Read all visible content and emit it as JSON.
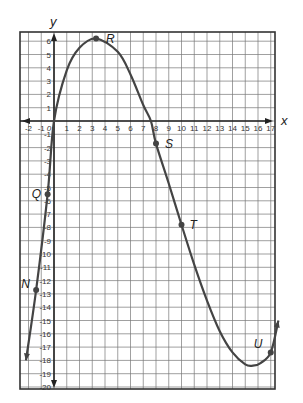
{
  "chart_data": {
    "type": "line",
    "title": "",
    "xlabel": "x",
    "ylabel": "y",
    "xlim": [
      -2.7,
      17.7
    ],
    "ylim": [
      -20.8,
      6.6
    ],
    "grid": true,
    "x_ticks": [
      -2,
      -1,
      0,
      1,
      2,
      3,
      4,
      5,
      6,
      7,
      8,
      9,
      10,
      11,
      12,
      13,
      14,
      15,
      16,
      17
    ],
    "y_ticks": [
      6,
      5,
      4,
      3,
      2,
      1,
      -1,
      -2,
      -3,
      -4,
      -5,
      -6,
      -7,
      -8,
      -9,
      -10,
      -11,
      -12,
      -13,
      -14,
      -15,
      -16,
      -17,
      -18,
      -19,
      -20
    ],
    "x_tick_labels": [
      "-2",
      "-1",
      "0",
      "1",
      "2",
      "3",
      "4",
      "5",
      "6",
      "7",
      "8",
      "9",
      "10",
      "11",
      "12",
      "13",
      "14",
      "15",
      "16",
      "17"
    ],
    "y_tick_labels": [
      "6",
      "5",
      "4",
      "3",
      "2",
      "1",
      "-1",
      "-2",
      "-3",
      "-4",
      "-5",
      "-6",
      "-7",
      "-8",
      "-9",
      "-10",
      "-11",
      "-12",
      "-13",
      "-14",
      "-15",
      "-16",
      "-17",
      "-18",
      "-19",
      "-20"
    ],
    "series": [
      {
        "name": "curve",
        "x": [
          -2.2,
          -1.4,
          -0.5,
          0,
          1,
          2,
          3.3,
          5,
          6,
          7,
          7.6,
          8,
          9,
          10,
          11,
          12,
          13,
          14,
          15,
          15.6,
          16.2,
          17,
          17.6
        ],
        "y": [
          -18,
          -12.7,
          -5.5,
          0,
          3.8,
          5.5,
          6.2,
          5.2,
          3.5,
          1.2,
          0,
          -1.7,
          -4.7,
          -7.8,
          -10.8,
          -13.5,
          -15.8,
          -17.4,
          -18.3,
          -18.4,
          -18.2,
          -17.4,
          -15
        ]
      }
    ],
    "points": [
      {
        "label": "R",
        "x": 3.3,
        "y": 6.2
      },
      {
        "label": "S",
        "x": 8,
        "y": -1.7
      },
      {
        "label": "T",
        "x": 10,
        "y": -7.8
      },
      {
        "label": "Q",
        "x": -0.5,
        "y": -5.5
      },
      {
        "label": "N",
        "x": -1.4,
        "y": -12.7
      },
      {
        "label": "U",
        "x": 17,
        "y": -17.4
      }
    ],
    "origin_label": "0"
  }
}
